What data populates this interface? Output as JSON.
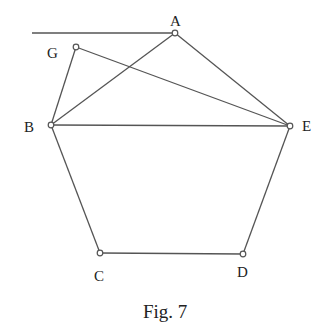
{
  "figure": {
    "caption": "Fig. 7",
    "line_color": "#555555",
    "points": {
      "A": {
        "label": "A",
        "x": 175,
        "y": 33
      },
      "B": {
        "label": "B",
        "x": 51,
        "y": 125
      },
      "C": {
        "label": "C",
        "x": 100,
        "y": 253
      },
      "D": {
        "label": "D",
        "x": 243,
        "y": 254
      },
      "E": {
        "label": "E",
        "x": 290,
        "y": 126
      },
      "G": {
        "label": "G",
        "x": 76,
        "y": 47
      }
    },
    "segments": [
      [
        "A",
        "B"
      ],
      [
        "A",
        "E"
      ],
      [
        "B",
        "E"
      ],
      [
        "G",
        "B"
      ],
      [
        "G",
        "E"
      ],
      [
        "B",
        "C"
      ],
      [
        "C",
        "D"
      ],
      [
        "D",
        "E"
      ]
    ],
    "horizontal_line": {
      "from_x": 32,
      "to": "A"
    }
  }
}
